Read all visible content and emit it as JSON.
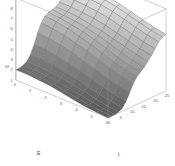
{
  "chart_data": {
    "type": "surface",
    "title": "",
    "xlabel": "E",
    "ylabel": "t",
    "zlabel": "ω",
    "x_ticks": [
      "0",
      "1",
      "2",
      "3",
      "4",
      "5",
      "6"
    ],
    "y_ticks": [
      "0",
      "5",
      "10",
      "15",
      "20",
      "25"
    ],
    "z_ticks": [
      "1",
      "2",
      "3",
      "4",
      "5",
      "6",
      "7",
      "8",
      "9"
    ],
    "xlim": [
      0,
      6
    ],
    "ylim": [
      0,
      25
    ],
    "zlim": [
      1,
      9
    ],
    "grid": false,
    "colormap": "gray",
    "z": [
      [
        2.0,
        2.0,
        2.1,
        2.3,
        2.8,
        3.6,
        4.6,
        5.4,
        5.9,
        6.1,
        6.2,
        6.3,
        6.6,
        7.1,
        7.6,
        7.9,
        8.0
      ],
      [
        2.0,
        2.0,
        2.1,
        2.3,
        2.8,
        3.6,
        4.5,
        5.3,
        5.8,
        6.0,
        6.1,
        6.3,
        6.6,
        7.1,
        7.6,
        7.9,
        8.0
      ],
      [
        1.9,
        1.9,
        2.0,
        2.2,
        2.7,
        3.4,
        4.3,
        5.1,
        5.6,
        5.8,
        6.0,
        6.2,
        6.5,
        7.0,
        7.5,
        7.8,
        7.9
      ],
      [
        1.8,
        1.8,
        1.9,
        2.1,
        2.5,
        3.2,
        4.1,
        4.8,
        5.3,
        5.6,
        5.8,
        6.0,
        6.4,
        6.9,
        7.4,
        7.7,
        7.8
      ],
      [
        1.6,
        1.6,
        1.7,
        1.9,
        2.3,
        2.9,
        3.7,
        4.5,
        5.0,
        5.3,
        5.5,
        5.8,
        6.2,
        6.7,
        7.2,
        7.5,
        7.6
      ],
      [
        1.4,
        1.4,
        1.5,
        1.7,
        2.0,
        2.6,
        3.4,
        4.1,
        4.6,
        4.9,
        5.2,
        5.5,
        5.9,
        6.4,
        6.9,
        7.2,
        7.3
      ],
      [
        1.2,
        1.2,
        1.3,
        1.4,
        1.7,
        2.3,
        3.0,
        3.7,
        4.2,
        4.5,
        4.8,
        5.2,
        5.6,
        6.1,
        6.6,
        6.9,
        7.0
      ],
      [
        1.1,
        1.1,
        1.1,
        1.2,
        1.5,
        2.0,
        2.7,
        3.4,
        3.9,
        4.2,
        4.5,
        4.9,
        5.3,
        5.8,
        6.3,
        6.6,
        6.7
      ],
      [
        1.0,
        1.0,
        1.0,
        1.1,
        1.3,
        1.8,
        2.5,
        3.2,
        3.7,
        4.0,
        4.3,
        4.7,
        5.1,
        5.6,
        6.1,
        6.4,
        6.5
      ]
    ]
  },
  "colors": {
    "box": "#9a9a9a",
    "mesh": "#6a6a6a",
    "surface_low": "#5a5a5a",
    "surface_high": "#f2f2f2"
  }
}
